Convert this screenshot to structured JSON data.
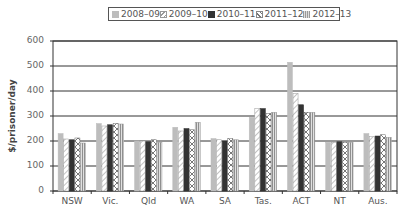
{
  "chart_data": {
    "type": "bar",
    "title": "",
    "xlabel": "",
    "ylabel": "$/prisoner/day",
    "ylim": [
      0,
      600
    ],
    "yticks": [
      0,
      100,
      200,
      300,
      400,
      500,
      600
    ],
    "grid": true,
    "legend_position": "top",
    "categories": [
      "NSW",
      "Vic.",
      "Qld",
      "WA",
      "SA",
      "Tas.",
      "ACT",
      "NT",
      "Aus."
    ],
    "series": [
      {
        "name": "2008–09",
        "pattern": "solid-light-gray",
        "color": "#bdbdbd",
        "values": [
          230,
          270,
          200,
          255,
          210,
          295,
          515,
          195,
          230
        ]
      },
      {
        "name": "2009–10",
        "pattern": "diagonal-hatch",
        "color": "#ffffff",
        "values": [
          208,
          260,
          200,
          240,
          205,
          330,
          390,
          195,
          218
        ]
      },
      {
        "name": "2010–11",
        "pattern": "solid-dark",
        "color": "#333333",
        "values": [
          205,
          265,
          197,
          250,
          200,
          330,
          345,
          197,
          220
        ]
      },
      {
        "name": "2011–12",
        "pattern": "cross-hatch",
        "color": "#ffffff",
        "values": [
          212,
          270,
          205,
          245,
          210,
          310,
          315,
          195,
          225
        ]
      },
      {
        "name": "2012–13",
        "pattern": "vertical-stripes",
        "color": "#999999",
        "values": [
          192,
          268,
          195,
          275,
          205,
          315,
          315,
          195,
          215
        ]
      }
    ]
  },
  "legend": {
    "items": [
      "2008–09",
      "2009–10",
      "2010–11",
      "2011–12",
      "2012–13"
    ]
  },
  "axis": {
    "ylabel": "$/prisoner/day",
    "yticks": [
      "0",
      "100",
      "200",
      "300",
      "400",
      "500",
      "600"
    ],
    "xticks": [
      "NSW",
      "Vic.",
      "Qld",
      "WA",
      "SA",
      "Tas.",
      "ACT",
      "NT",
      "Aus."
    ]
  }
}
